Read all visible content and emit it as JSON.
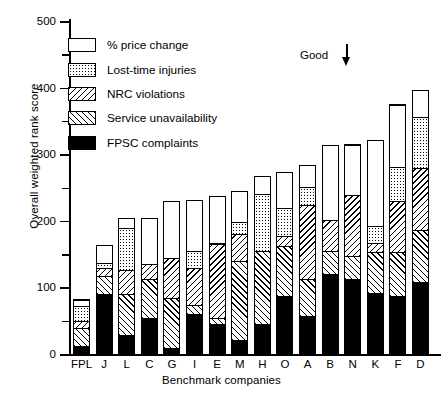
{
  "chart_data": {
    "type": "bar",
    "title": "",
    "subtitle": "",
    "stacked": true,
    "orientation": "vertical",
    "xlabel": "Benchmark companies",
    "ylabel": "Overall weighted rank score",
    "ylim": [
      0,
      500
    ],
    "yticks_major": [
      0,
      100,
      200,
      300,
      400,
      500
    ],
    "yticks_minor": [
      50,
      150,
      250,
      350,
      450
    ],
    "grid": false,
    "legend_position": "upper-left",
    "categories": [
      "FPL",
      "J",
      "L",
      "C",
      "G",
      "I",
      "E",
      "M",
      "H",
      "O",
      "A",
      "B",
      "N",
      "K",
      "F",
      "D"
    ],
    "series": [
      {
        "name": "FPSC complaints",
        "fill": "solid-black",
        "values": [
          11,
          89,
          27,
          52,
          8,
          58,
          43,
          19,
          43,
          86,
          56,
          118,
          111,
          90,
          86,
          106
        ]
      },
      {
        "name": "Service unavailability",
        "fill": "hatch-forward",
        "values": [
          26,
          26,
          62,
          59,
          75,
          14,
          9,
          119,
          110,
          74,
          55,
          35,
          34,
          61,
          65,
          78
        ]
      },
      {
        "name": "NRC violations",
        "fill": "hatch-backward",
        "values": [
          11,
          12,
          36,
          22,
          60,
          55,
          112,
          40,
          0,
          16,
          111,
          46,
          92,
          14,
          77,
          94
        ]
      },
      {
        "name": "Lost-time injuries",
        "fill": "dotted",
        "values": [
          22,
          8,
          63,
          0,
          0,
          26,
          1,
          18,
          86,
          42,
          28,
          0,
          0,
          25,
          51,
          77
        ]
      },
      {
        "name": "% price change",
        "fill": "white",
        "values": [
          10,
          27,
          14,
          70,
          85,
          77,
          71,
          47,
          27,
          54,
          32,
          113,
          76,
          130,
          94,
          40
        ]
      }
    ],
    "totals": [
      80,
      162,
      202,
      203,
      228,
      230,
      236,
      243,
      266,
      272,
      282,
      312,
      313,
      320,
      373,
      395
    ],
    "annotations": [
      {
        "name": "good-direction",
        "text": "Good",
        "icon": "down-arrow-icon"
      }
    ]
  },
  "legend": {
    "items": [
      {
        "label": "% price change",
        "fill": "white"
      },
      {
        "label": "Lost-time injuries",
        "fill": "dotted"
      },
      {
        "label": "NRC violations",
        "fill": "hatch-backward"
      },
      {
        "label": "Service unavailability",
        "fill": "hatch-forward"
      },
      {
        "label": "FPSC complaints",
        "fill": "solid-black"
      }
    ]
  },
  "annotation": {
    "good_label": "Good",
    "arrow": "↓"
  },
  "colors": {
    "ink": "#000000",
    "paper": "#ffffff"
  }
}
